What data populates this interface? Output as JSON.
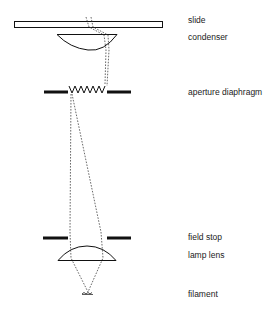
{
  "diagram": {
    "labels": {
      "slide": "slide",
      "condenser": "condenser",
      "aperture_diaphragm": "aperture diaphragm",
      "field_stop": "field stop",
      "lamp_lens": "lamp lens",
      "filament": "filament"
    },
    "components": [
      {
        "name": "slide",
        "label_y": 15
      },
      {
        "name": "condenser",
        "label_y": 32
      },
      {
        "name": "aperture diaphragm",
        "label_y": 87
      },
      {
        "name": "field stop",
        "label_y": 232
      },
      {
        "name": "lamp lens",
        "label_y": 250
      },
      {
        "name": "filament",
        "label_y": 289
      }
    ],
    "colors": {
      "stroke": "#111111",
      "ray": "#444444",
      "text": "#222222",
      "background": "#ffffff"
    }
  }
}
